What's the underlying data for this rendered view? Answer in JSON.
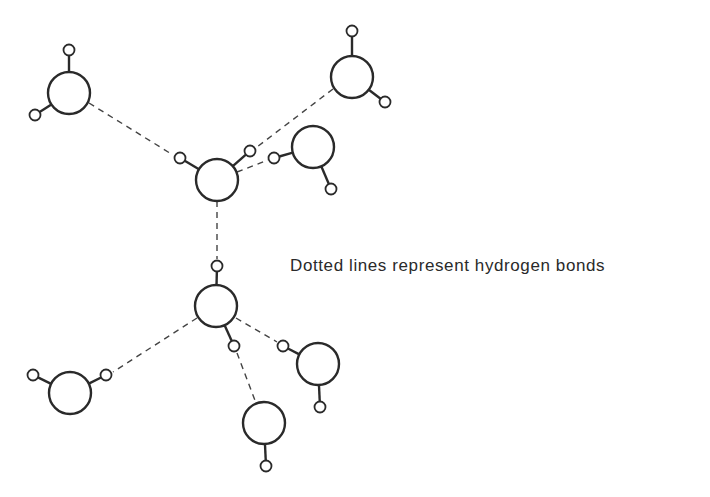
{
  "caption": "Dotted lines represent hydrogen bonds",
  "colors": {
    "stroke": "#2a2a2a",
    "hbond": "#444444",
    "background": "#ffffff"
  },
  "molecules": [
    {
      "id": "top-left",
      "o": [
        69,
        93
      ],
      "h": [
        [
          69,
          50
        ],
        [
          35,
          115
        ]
      ]
    },
    {
      "id": "top-right",
      "o": [
        352,
        77
      ],
      "h": [
        [
          352,
          31
        ],
        [
          385,
          102
        ]
      ]
    },
    {
      "id": "central-upper",
      "o": [
        217,
        180
      ],
      "h": [
        [
          180,
          158
        ],
        [
          250,
          151
        ]
      ]
    },
    {
      "id": "right-mid",
      "o": [
        313,
        147
      ],
      "h": [
        [
          274,
          158
        ],
        [
          331,
          189
        ]
      ]
    },
    {
      "id": "central-lower",
      "o": [
        216,
        306
      ],
      "h": [
        [
          217,
          266
        ],
        [
          234,
          346
        ]
      ]
    },
    {
      "id": "bottom-left",
      "o": [
        70,
        393
      ],
      "h": [
        [
          33,
          375
        ],
        [
          106,
          375
        ]
      ]
    },
    {
      "id": "bottom-right",
      "o": [
        318,
        364
      ],
      "h": [
        [
          283,
          346
        ],
        [
          320,
          407
        ]
      ]
    },
    {
      "id": "bottom",
      "o": [
        264,
        423
      ],
      "h": [
        [
          266,
          466
        ]
      ]
    }
  ],
  "hydrogen_bonds": [
    {
      "from": [
        89,
        103
      ],
      "to": [
        173,
        155
      ]
    },
    {
      "from": [
        333,
        89
      ],
      "to": [
        257,
        147
      ]
    },
    {
      "from": [
        237,
        172
      ],
      "to": [
        268,
        160
      ]
    },
    {
      "from": [
        217,
        201
      ],
      "to": [
        217,
        259
      ]
    },
    {
      "from": [
        197,
        318
      ],
      "to": [
        113,
        372
      ]
    },
    {
      "from": [
        236,
        318
      ],
      "to": [
        277,
        342
      ]
    },
    {
      "from": [
        237,
        353
      ],
      "to": [
        256,
        403
      ]
    }
  ],
  "radii": {
    "oxygen": 21,
    "hydrogen": 5.5
  }
}
